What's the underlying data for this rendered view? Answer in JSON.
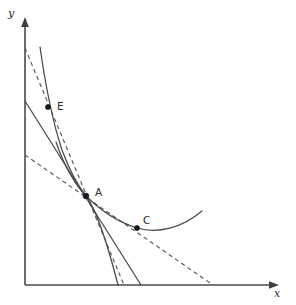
{
  "figure": {
    "width": 296,
    "height": 305,
    "background_color": "#ffffff",
    "stroke_color": "#4a4a4a",
    "point_color": "#1a1a1a"
  },
  "axes": {
    "x_label": "x",
    "y_label": "y",
    "origin": {
      "x": 25,
      "y": 285
    },
    "x_axis_end": {
      "x": 278,
      "y": 285
    },
    "y_axis_end": {
      "x": 25,
      "y": 18
    },
    "x_label_pos": {
      "x": 277,
      "y": 296
    },
    "y_label_pos": {
      "x": 10,
      "y": 17
    },
    "ticks": [],
    "grid": false
  },
  "points": [
    {
      "id": "E",
      "label": "E",
      "x": 48,
      "y": 107,
      "label_x": 57,
      "label_y": 110,
      "radius": 2.6
    },
    {
      "id": "A",
      "label": "A",
      "x": 86,
      "y": 196,
      "label_x": 95,
      "label_y": 196,
      "radius": 2.9
    },
    {
      "id": "C",
      "label": "C",
      "x": 137,
      "y": 228,
      "label_x": 143,
      "label_y": 224,
      "radius": 2.6
    }
  ],
  "curves": [
    {
      "id": "indifference-curve-upper",
      "name": "upper indifference curve",
      "style": "solid",
      "path": "M 40,47 C 45,82 52,120 62,150 C 70,172 79,187 86,196 C 95,208 106,238 118,285"
    },
    {
      "id": "indifference-curve-lower",
      "name": "lower indifference curve",
      "style": "solid",
      "path": "M 56,142 C 64,166 76,186 86,196 C 100,210 118,222 137,228 C 158,234 182,228 202,211"
    }
  ],
  "lines": [
    {
      "id": "budget-line-solid",
      "name": "solid budget line through A",
      "style": "solid",
      "x1": 25,
      "y1": 101,
      "x2": 141,
      "y2": 285
    },
    {
      "id": "budget-line-dashed-steep",
      "name": "steep dashed budget line through E and A",
      "style": "dashed",
      "x1": 25,
      "y1": 48,
      "x2": 124,
      "y2": 285
    },
    {
      "id": "budget-line-dashed-shallow",
      "name": "shallow dashed budget line through A and C",
      "style": "dashed",
      "x1": 25,
      "y1": 155,
      "x2": 213,
      "y2": 285
    }
  ],
  "chart_data": {
    "type": "line",
    "title": "",
    "xlabel": "x",
    "ylabel": "y",
    "legend": [],
    "grid": false,
    "series": [
      {
        "name": "upper indifference curve",
        "style": "solid",
        "points": [
          [
            40,
            47
          ],
          [
            48,
            107
          ],
          [
            62,
            150
          ],
          [
            86,
            196
          ],
          [
            118,
            285
          ]
        ]
      },
      {
        "name": "lower indifference curve",
        "style": "solid",
        "points": [
          [
            56,
            142
          ],
          [
            86,
            196
          ],
          [
            137,
            228
          ],
          [
            202,
            211
          ]
        ]
      },
      {
        "name": "solid budget line",
        "style": "solid",
        "points": [
          [
            25,
            101
          ],
          [
            86,
            196
          ],
          [
            141,
            285
          ]
        ]
      },
      {
        "name": "steep dashed budget line",
        "style": "dashed",
        "points": [
          [
            25,
            48
          ],
          [
            48,
            107
          ],
          [
            86,
            196
          ],
          [
            124,
            285
          ]
        ]
      },
      {
        "name": "shallow dashed budget line",
        "style": "dashed",
        "points": [
          [
            25,
            155
          ],
          [
            86,
            196
          ],
          [
            137,
            228
          ],
          [
            213,
            285
          ]
        ]
      }
    ],
    "annotations": [
      {
        "label": "E",
        "x": 48,
        "y": 107
      },
      {
        "label": "A",
        "x": 86,
        "y": 196
      },
      {
        "label": "C",
        "x": 137,
        "y": 228
      }
    ]
  }
}
